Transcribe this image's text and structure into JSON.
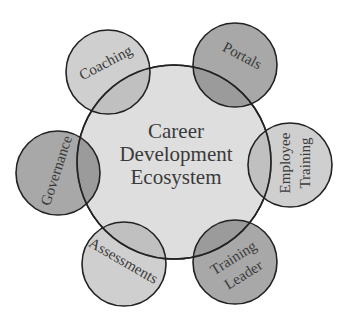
{
  "diagram": {
    "type": "hub-and-satellite venn",
    "center": {
      "lines": [
        "Career",
        "Development",
        "Ecosystem"
      ],
      "fill": "#dedede"
    },
    "satellites": [
      {
        "id": "coaching",
        "label_lines": [
          "Coaching"
        ],
        "fill": "#c4c4c4"
      },
      {
        "id": "portals",
        "label_lines": [
          "Portals"
        ],
        "fill": "#8e8e8e"
      },
      {
        "id": "employee-training",
        "label_lines": [
          "Employee",
          "Training"
        ],
        "fill": "#c4c4c4"
      },
      {
        "id": "training-leader",
        "label_lines": [
          "Training",
          "Leader"
        ],
        "fill": "#8e8e8e"
      },
      {
        "id": "assessments",
        "label_lines": [
          "Assessments"
        ],
        "fill": "#c4c4c4"
      },
      {
        "id": "governance",
        "label_lines": [
          "Governance"
        ],
        "fill": "#8e8e8e"
      }
    ],
    "stroke": "#222222"
  }
}
